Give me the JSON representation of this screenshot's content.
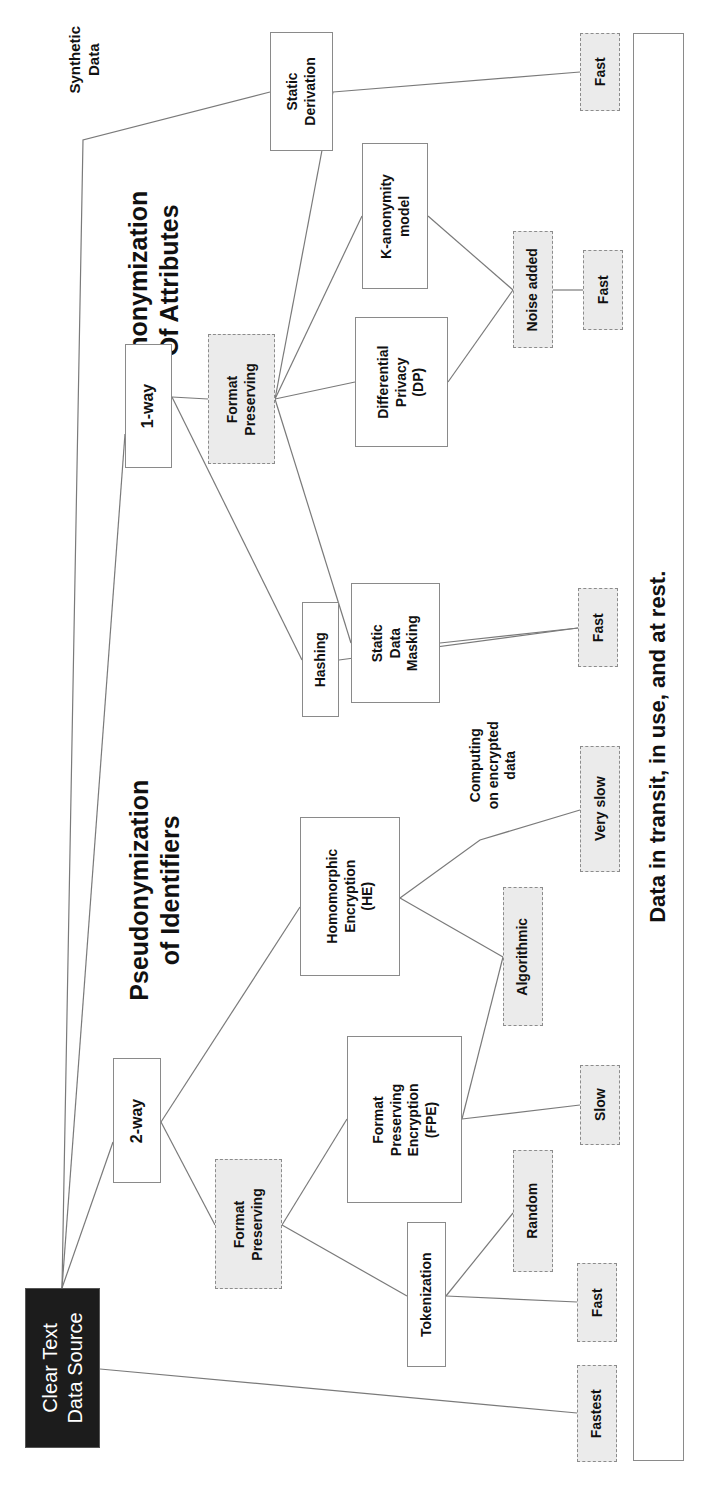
{
  "diagram": {
    "orientation": "rotated-90-ccw",
    "titles": {
      "pseudonymization": "Pseudonymization\nof Identifiers",
      "anonymization": "Anonymization\nOf Attributes",
      "synthetic": "Synthetic\nData",
      "computing": "Computing\non encrypted\ndata"
    },
    "root": {
      "label": "Clear Text\nData Source"
    },
    "bottom_bar": {
      "label": "Data in transit, in use, and at rest."
    },
    "two_way": {
      "label": "2-way",
      "format_preserving": "Format\nPreserving",
      "tokenization": "Tokenization",
      "fpe": "Format\nPreserving\nEncryption\n(FPE)",
      "he": "Homomorphic\nEncryption\n(HE)",
      "random": "Random",
      "algorithmic": "Algorithmic",
      "speed_token": "Fast",
      "speed_fpe": "Slow",
      "speed_he": "Very slow"
    },
    "one_way": {
      "label": "1-way",
      "format_preserving": "Format\nPreserving",
      "hashing": "Hashing",
      "static_masking": "Static\nData\nMasking",
      "differential_privacy": "Differential\nPrivacy\n(DP)",
      "k_anonymity": "K-anonymity\nmodel",
      "noise_added": "Noise added",
      "speed_hash": "Fast",
      "speed_noise": "Fast"
    },
    "synthetic": {
      "static_derivation": "Static\nDerivation",
      "speed": "Fast"
    },
    "speed_root": "Fastest"
  },
  "colors": {
    "root_bg": "#1c1c1c",
    "dashed_bg": "#ebebeb",
    "line": "#7a7a7a",
    "border": "#8a8a8a"
  }
}
